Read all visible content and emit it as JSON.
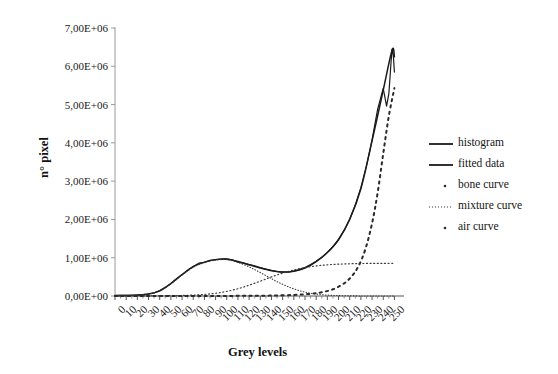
{
  "chart_data": {
    "type": "line",
    "title": "",
    "xlabel": "Grey levels",
    "ylabel": "n° pixel",
    "xlim": [
      0,
      255
    ],
    "ylim": [
      0,
      7000000
    ],
    "grid": false,
    "legend_position": "right",
    "xticks": [
      0,
      10,
      20,
      30,
      40,
      50,
      60,
      70,
      80,
      90,
      100,
      110,
      120,
      130,
      140,
      150,
      160,
      170,
      180,
      190,
      200,
      210,
      220,
      230,
      240,
      250
    ],
    "xtick_labels": [
      "0",
      "10",
      "20",
      "30",
      "40",
      "50",
      "60",
      "70",
      "80",
      "90",
      "100",
      "110",
      "120",
      "130",
      "140",
      "150",
      "160",
      "170",
      "180",
      "190",
      "200",
      "210",
      "220",
      "230",
      "240",
      "250"
    ],
    "yticks": [
      0,
      1000000,
      2000000,
      3000000,
      4000000,
      5000000,
      6000000,
      7000000
    ],
    "ytick_labels": [
      "0,00E+00",
      "1,00E+06",
      "2,00E+06",
      "3,00E+06",
      "4,00E+06",
      "5,00E+06",
      "6,00E+06",
      "7,00E+06"
    ],
    "series": [
      {
        "name": "histogram",
        "style": "solid-noisy",
        "color": "#1a1a1a",
        "x": [
          0,
          5,
          10,
          15,
          20,
          25,
          30,
          35,
          40,
          45,
          50,
          55,
          60,
          65,
          70,
          75,
          80,
          85,
          90,
          95,
          100,
          105,
          110,
          115,
          120,
          125,
          130,
          135,
          140,
          145,
          150,
          155,
          160,
          165,
          170,
          175,
          180,
          185,
          190,
          195,
          200,
          205,
          210,
          215,
          220,
          225,
          230,
          235,
          240,
          243,
          245,
          246,
          247,
          248,
          249,
          250
        ],
        "values": [
          12000,
          14000,
          16000,
          20000,
          26000,
          36000,
          52000,
          84000,
          140000,
          225000,
          330000,
          452000,
          560000,
          672000,
          770000,
          858000,
          880000,
          930000,
          952000,
          962000,
          968000,
          945000,
          885000,
          860000,
          820000,
          790000,
          742000,
          700000,
          668000,
          640000,
          625000,
          628000,
          650000,
          688000,
          742000,
          820000,
          905000,
          1010000,
          1140000,
          1290000,
          1480000,
          1720000,
          2010000,
          2380000,
          2830000,
          3400000,
          4080000,
          4880000,
          5420000,
          4960000,
          5280000,
          5680000,
          6120000,
          6450000,
          6300000,
          5850000
        ]
      },
      {
        "name": "fitted data",
        "style": "solid",
        "color": "#1a1a1a",
        "x": [
          0,
          10,
          20,
          30,
          40,
          50,
          60,
          70,
          80,
          90,
          100,
          110,
          120,
          130,
          140,
          150,
          160,
          170,
          180,
          190,
          200,
          210,
          220,
          230,
          240,
          248,
          250
        ],
        "values": [
          10000,
          15000,
          25000,
          50000,
          135000,
          325000,
          555000,
          765000,
          885000,
          950000,
          962000,
          900000,
          818000,
          730000,
          662000,
          624000,
          648000,
          730000,
          900000,
          1135000,
          1470000,
          2000000,
          2800000,
          4050000,
          5380000,
          6430000,
          6250000
        ]
      },
      {
        "name": "bone curve",
        "style": "dotted-fine",
        "color": "#3a3a3a",
        "x": [
          0,
          10,
          20,
          30,
          40,
          50,
          60,
          70,
          80,
          90,
          100,
          110,
          120,
          130,
          140,
          150,
          160,
          170,
          180,
          190,
          200,
          210,
          220,
          230,
          240,
          250
        ],
        "values": [
          8000,
          13000,
          22000,
          48000,
          130000,
          320000,
          548000,
          752000,
          872000,
          938000,
          950000,
          878000,
          760000,
          612000,
          452000,
          305000,
          186000,
          102000,
          52000,
          24000,
          10000,
          4000,
          1500,
          500,
          200,
          100
        ]
      },
      {
        "name": "mixture curve",
        "style": "dotted-med",
        "color": "#3a3a3a",
        "x": [
          0,
          10,
          20,
          30,
          40,
          50,
          60,
          70,
          80,
          90,
          100,
          110,
          120,
          130,
          140,
          150,
          160,
          170,
          180,
          190,
          200,
          210,
          220,
          230,
          240,
          250
        ],
        "values": [
          1000,
          1500,
          2000,
          3000,
          5000,
          8000,
          14000,
          24000,
          42000,
          72000,
          120000,
          190000,
          282000,
          388000,
          498000,
          598000,
          680000,
          742000,
          786000,
          815000,
          832000,
          842000,
          848000,
          851000,
          852000,
          853000
        ]
      },
      {
        "name": "air curve",
        "style": "dotted-coarse",
        "color": "#2a2a2a",
        "x": [
          0,
          20,
          40,
          60,
          80,
          100,
          120,
          140,
          160,
          175,
          185,
          195,
          205,
          212,
          218,
          224,
          230,
          235,
          240,
          245,
          250
        ],
        "values": [
          200,
          300,
          500,
          800,
          1400,
          2500,
          5000,
          11000,
          28000,
          58000,
          98000,
          175000,
          330000,
          520000,
          790000,
          1220000,
          1900000,
          2700000,
          3720000,
          4700000,
          5430000
        ]
      }
    ]
  },
  "legend": {
    "items": [
      {
        "label": "histogram",
        "marker": "solid-line"
      },
      {
        "label": "fitted data",
        "marker": "solid-line"
      },
      {
        "label": "bone curve",
        "marker": "dot"
      },
      {
        "label": "mixture curve",
        "marker": "dotted-line"
      },
      {
        "label": "air curve",
        "marker": "dot"
      }
    ]
  }
}
